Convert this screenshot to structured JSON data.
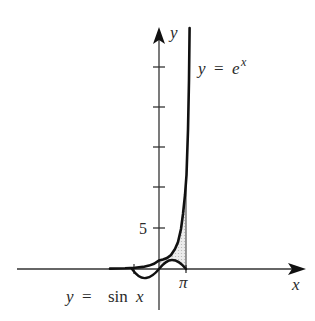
{
  "figure": {
    "axes": {
      "x_label": "x",
      "y_label": "y",
      "y_tick_label": "5",
      "x_tick_label": "π"
    },
    "curves": [
      {
        "name": "exponential",
        "label_lhs": "y",
        "label_eq": "=",
        "label_rhs": "e",
        "label_sup": "x"
      },
      {
        "name": "sine",
        "label_lhs": "y",
        "label_eq": "=",
        "label_rhs": "sin",
        "label_var": "x"
      }
    ],
    "shaded_region": {
      "from": "0",
      "to": "π",
      "fill": "#d9d9d9"
    },
    "colors": {
      "axis": "#333333",
      "curve": "#111111",
      "shade": "#d9d9d9",
      "text": "#2a2a2a"
    }
  }
}
